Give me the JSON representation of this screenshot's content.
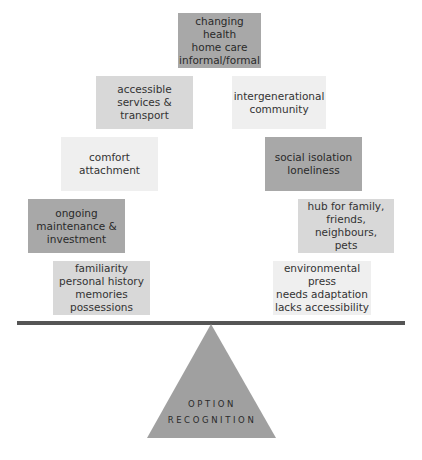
{
  "diagram": {
    "type": "balance-scale",
    "top": {
      "text": "changing health\nhome care\ninformal/formal",
      "shade": "dark"
    },
    "left_side": [
      {
        "text": "accessible\nservices & transport",
        "shade": "mid"
      },
      {
        "text": "comfort\nattachment",
        "shade": "light"
      },
      {
        "text": "ongoing\nmaintenance &\ninvestment",
        "shade": "dark"
      },
      {
        "text": "familiarity\npersonal history\nmemories\npossessions",
        "shade": "mid"
      }
    ],
    "right_side": [
      {
        "text": "intergenerational\ncommunity",
        "shade": "light"
      },
      {
        "text": "social isolation\nloneliness",
        "shade": "dark"
      },
      {
        "text": "hub for family,\nfriends, neighbours,\npets",
        "shade": "mid"
      },
      {
        "text": "environmental\npress\nneeds adaptation\nlacks accessibility",
        "shade": "light"
      }
    ],
    "fulcrum": {
      "line1": "OPTION",
      "line2": "RECOGNITION"
    },
    "colors": {
      "dark": "#a8a8a8",
      "mid": "#d8d8d8",
      "light": "#efefef",
      "beam": "#555555",
      "fulcrum": "#a0a0a0"
    }
  }
}
